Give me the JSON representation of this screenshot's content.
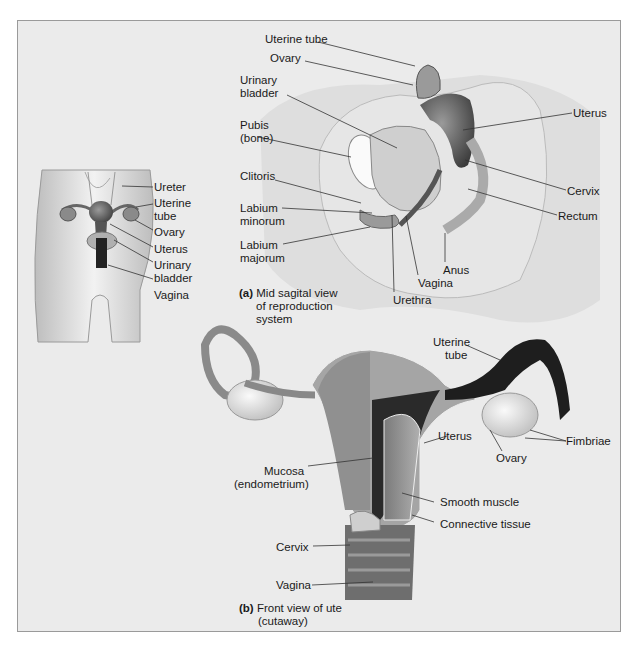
{
  "figure": {
    "inset": {
      "labels": [
        "Ureter",
        "Uterine",
        "tube",
        "Ovary",
        "Uterus",
        "Urinary",
        "bladder",
        "Vagina"
      ]
    },
    "panel_a": {
      "tag": "(a)",
      "caption_lines": [
        "Mid sagital view",
        "of reproduction",
        "system"
      ],
      "labels": {
        "uterine_tube": "Uterine tube",
        "ovary": "Ovary",
        "urinary_bladder_1": "Urinary",
        "urinary_bladder_2": "bladder",
        "pubis_1": "Pubis",
        "pubis_2": "(bone)",
        "uterus": "Uterus",
        "clitoris": "Clitoris",
        "labium_minorum_1": "Labium",
        "labium_minorum_2": "minorum",
        "labium_majorum_1": "Labium",
        "labium_majorum_2": "majorum",
        "cervix": "Cervix",
        "rectum": "Rectum",
        "anus": "Anus",
        "vagina": "Vagina",
        "urethra": "Urethra"
      }
    },
    "panel_b": {
      "tag": "(b)",
      "caption_lines": [
        "Front view of ute",
        "(cutaway)"
      ],
      "labels": {
        "uterine_tube_1": "Uterine",
        "uterine_tube_2": "tube",
        "uterus": "Uterus",
        "fimbriae": "Fimbriae",
        "ovary": "Ovary",
        "mucosa_1": "Mucosa",
        "mucosa_2": "(endometrium)",
        "smooth_muscle": "Smooth muscle",
        "connective_tissue": "Connective tissue",
        "cervix": "Cervix",
        "vagina": "Vagina"
      }
    },
    "colors": {
      "background": "#ebebeb",
      "frame_border": "#9a9a9a",
      "text": "#1a1a1a",
      "tissue_light": "#d9d9d9",
      "tissue_mid": "#8c8c8c",
      "tissue_dark": "#3a3a3a"
    }
  }
}
